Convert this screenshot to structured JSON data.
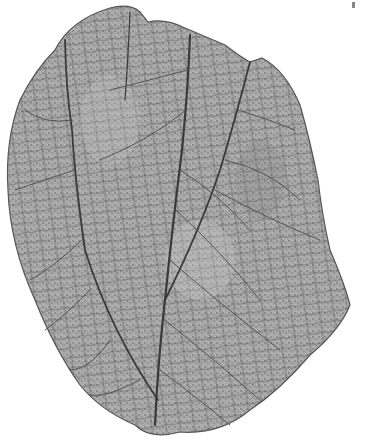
{
  "image": {
    "subject": "Fossil leaf illustration",
    "description": "Grayscale engraving of a broad fossil leaf with a central midrib, two strong lateral veins branching from the base, and a dense reticulate network of fine secondary veins",
    "colors": {
      "background": "#ffffff",
      "leaf_fill": "#9a9a9a",
      "leaf_light": "#c4c4c4",
      "vein_dark": "#3a3a3a",
      "outline": "#555555"
    }
  }
}
